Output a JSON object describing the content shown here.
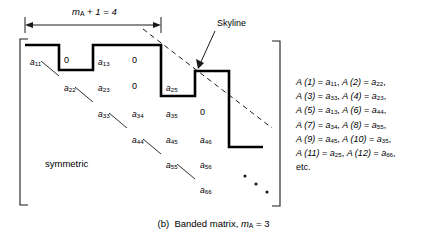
{
  "figure": {
    "caption_prefix": "(b)",
    "caption_text": "Banded matrix,",
    "caption_var": "m",
    "caption_var_sub": "A",
    "caption_eq": "= 3",
    "dimension_label_var": "m",
    "dimension_label_sub": "A",
    "dimension_label_rest": "+ 1 = 4",
    "skyline_label": "Skyline",
    "symmetric_label": "symmetric",
    "ellipsis_label": "diagonal-dots"
  },
  "matrix": {
    "entries": [
      {
        "name": "a",
        "sub": "11",
        "x": 30,
        "y": 58
      },
      {
        "name": "a",
        "sub": "13",
        "x": 98,
        "y": 58
      },
      {
        "name": "a",
        "sub": "22",
        "x": 64,
        "y": 84
      },
      {
        "name": "a",
        "sub": "23",
        "x": 98,
        "y": 84
      },
      {
        "name": "a",
        "sub": "25",
        "x": 166,
        "y": 84
      },
      {
        "name": "a",
        "sub": "33",
        "x": 98,
        "y": 110
      },
      {
        "name": "a",
        "sub": "34",
        "x": 132,
        "y": 110
      },
      {
        "name": "a",
        "sub": "35",
        "x": 166,
        "y": 110
      },
      {
        "name": "a",
        "sub": "44",
        "x": 132,
        "y": 136
      },
      {
        "name": "a",
        "sub": "45",
        "x": 166,
        "y": 136
      },
      {
        "name": "a",
        "sub": "46",
        "x": 200,
        "y": 136
      },
      {
        "name": "a",
        "sub": "55",
        "x": 166,
        "y": 161
      },
      {
        "name": "a",
        "sub": "56",
        "x": 200,
        "y": 161
      },
      {
        "name": "a",
        "sub": "66",
        "x": 200,
        "y": 186
      }
    ],
    "zeros": [
      {
        "value": "0",
        "x": 64,
        "y": 56
      },
      {
        "value": "0",
        "x": 132,
        "y": 56
      },
      {
        "value": "0",
        "x": 132,
        "y": 82
      },
      {
        "value": "0",
        "x": 200,
        "y": 108
      }
    ]
  },
  "storage_list": {
    "lines": [
      [
        {
          "fn": "A (1)",
          "eq": "=",
          "var": "a",
          "sub": "11",
          "comma": ","
        },
        {
          "fn": "A (2)",
          "eq": "=",
          "var": "a",
          "sub": "22",
          "comma": ","
        }
      ],
      [
        {
          "fn": "A (3)",
          "eq": "=",
          "var": "a",
          "sub": "33",
          "comma": ","
        },
        {
          "fn": "A (4)",
          "eq": "=",
          "var": "a",
          "sub": "23",
          "comma": ","
        }
      ],
      [
        {
          "fn": "A (5)",
          "eq": "=",
          "var": "a",
          "sub": "13",
          "comma": ","
        },
        {
          "fn": "A (6)",
          "eq": "=",
          "var": "a",
          "sub": "44",
          "comma": ","
        }
      ],
      [
        {
          "fn": "A (7)",
          "eq": "=",
          "var": "a",
          "sub": "34",
          "comma": ","
        },
        {
          "fn": "A (8)",
          "eq": "=",
          "var": "a",
          "sub": "55",
          "comma": ","
        }
      ],
      [
        {
          "fn": "A (9)",
          "eq": "=",
          "var": "a",
          "sub": "45",
          "comma": ","
        },
        {
          "fn": "A (10)",
          "eq": "=",
          "var": "a",
          "sub": "35",
          "comma": ","
        }
      ],
      [
        {
          "fn": "A (11)",
          "eq": "=",
          "var": "a",
          "sub": "25",
          "comma": ","
        },
        {
          "fn": "A (12)",
          "eq": "=",
          "var": "a",
          "sub": "66",
          "comma": ","
        }
      ]
    ],
    "etc": "etc."
  },
  "colors": {
    "ink": "#000000",
    "paper": "#ffffff",
    "skyline_stroke": "#000000",
    "thin_stroke": "#1a1a1a"
  }
}
